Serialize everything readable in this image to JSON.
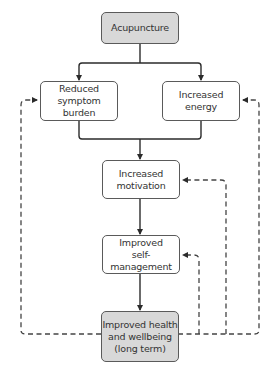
{
  "diagram": {
    "nodes": {
      "acupuncture": {
        "lines": [
          "Acupuncture"
        ],
        "fill": "#d8d8d8"
      },
      "reduced_symptom": {
        "lines": [
          "Reduced",
          "symptom burden"
        ],
        "fill": "#ffffff"
      },
      "increased_energy": {
        "lines": [
          "Increased",
          "energy"
        ],
        "fill": "#ffffff"
      },
      "increased_motivation": {
        "lines": [
          "Increased",
          "motivation"
        ],
        "fill": "#ffffff"
      },
      "improved_self_management": {
        "lines": [
          "Improved",
          "self-management"
        ],
        "fill": "#ffffff"
      },
      "improved_health": {
        "lines": [
          "Improved health",
          "and wellbeing",
          "(long term)"
        ],
        "fill": "#d8d8d8"
      }
    },
    "edges": [
      {
        "from": "acupuncture",
        "to": "reduced_symptom",
        "style": "solid"
      },
      {
        "from": "acupuncture",
        "to": "increased_energy",
        "style": "solid"
      },
      {
        "from": "reduced_symptom",
        "to": "increased_motivation",
        "style": "solid"
      },
      {
        "from": "increased_energy",
        "to": "increased_motivation",
        "style": "solid"
      },
      {
        "from": "increased_motivation",
        "to": "improved_self_management",
        "style": "solid"
      },
      {
        "from": "improved_self_management",
        "to": "improved_health",
        "style": "solid"
      },
      {
        "from": "improved_health",
        "to": "reduced_symptom",
        "style": "dashed"
      },
      {
        "from": "improved_health",
        "to": "increased_energy",
        "style": "dashed"
      },
      {
        "from": "improved_health",
        "to": "increased_motivation",
        "style": "dashed"
      },
      {
        "from": "improved_health",
        "to": "improved_self_management",
        "style": "dashed"
      }
    ],
    "colors": {
      "line": "#2b2b2b",
      "dashed": "#444444",
      "border": "#5a5a5a"
    }
  }
}
